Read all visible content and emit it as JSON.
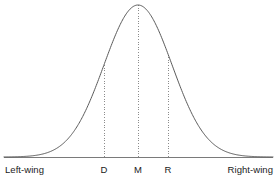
{
  "figure": {
    "width": 277,
    "height": 181,
    "background": "#ffffff",
    "curve_color": "#5a5a5a",
    "axis_color": "#7a7a7a",
    "marker_color": "#8c8c8c",
    "text_color": "#1a1a1a"
  },
  "chart_data": {
    "type": "line",
    "title": "",
    "subtitle": "",
    "xlabel": "",
    "ylabel": "",
    "grid": false,
    "legend": null,
    "axes": {
      "x_axis_visible": true,
      "y_axis_visible": false,
      "x_axis_y_pixel": 157,
      "x_axis_from_pixel": 4,
      "x_axis_to_pixel": 273,
      "xlim_labels": [
        "Left-wing",
        "Right-wing"
      ],
      "ylim": [
        0,
        1
      ]
    },
    "series": [
      {
        "name": "Normal distribution",
        "shape": "gaussian",
        "peak_x_pixel": 138,
        "peak_y_pixel": 5,
        "baseline_y_pixel": 157,
        "sigma_pixels": 34
      }
    ],
    "annotations": [
      {
        "label": "D",
        "x_pixel": 104,
        "line_style": "dotted",
        "from_y_pixel": 157,
        "to_y_pixel": 62,
        "meaning": "Democrat position"
      },
      {
        "label": "M",
        "x_pixel": 138,
        "line_style": "dotted",
        "from_y_pixel": 157,
        "to_y_pixel": 7,
        "meaning": "Median voter position"
      },
      {
        "label": "R",
        "x_pixel": 168,
        "line_style": "dotted",
        "from_y_pixel": 157,
        "to_y_pixel": 29,
        "meaning": "Republican position"
      }
    ],
    "axis_end_labels": {
      "left": "Left-wing",
      "right": "Right-wing"
    },
    "tick_labels": [
      "D",
      "M",
      "R"
    ]
  },
  "labels": {
    "left_wing": "Left-wing",
    "right_wing": "Right-wing",
    "d": "D",
    "m": "M",
    "r": "R"
  }
}
